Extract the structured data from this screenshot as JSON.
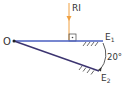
{
  "diagram": {
    "type": "two plane mirrors at an angle with incident ray",
    "labels": {
      "ray": "RI",
      "origin": "O",
      "mirror1": "E",
      "mirror1_sub": "1",
      "mirror2": "E",
      "mirror2_sub": "2",
      "angle": "20°"
    },
    "colors": {
      "ray": "#f0a040",
      "mirror1": "#4a5fc0",
      "mirror2": "#3c3470",
      "hatch": "#444444",
      "text": "#333333"
    },
    "angle_between_mirrors_deg": 20
  }
}
